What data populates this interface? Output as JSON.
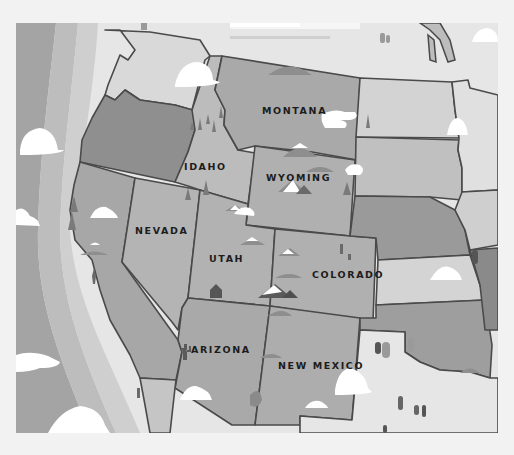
{
  "map": {
    "title": "Western United States illustrated map",
    "style": "grayscale illustration",
    "colors": {
      "background": "#f2f2f2",
      "ocean_outer": "#a4a4a4",
      "ocean_mid": "#bdbdbd",
      "ocean_inner": "#cfcfcf",
      "coast_foam": "#e4e4e4",
      "border": "#4a4a4a",
      "label": "#1c1c1c",
      "cloud": "#ffffff"
    },
    "states": [
      {
        "name": "Washington",
        "label": "",
        "fill": "#d9d9d9"
      },
      {
        "name": "Oregon",
        "label": "",
        "fill": "#8f8f8f"
      },
      {
        "name": "California",
        "label": "",
        "fill": "#a7a7a7"
      },
      {
        "name": "Idaho",
        "label": "IDAHO",
        "fill": "#bcbcbc"
      },
      {
        "name": "Nevada",
        "label": "NEVADA",
        "fill": "#b4b4b4"
      },
      {
        "name": "Montana",
        "label": "MONTANA",
        "fill": "#a9a9a9"
      },
      {
        "name": "Wyoming",
        "label": "WYOMING",
        "fill": "#b0b0b0"
      },
      {
        "name": "Utah",
        "label": "UTAH",
        "fill": "#b2b2b2"
      },
      {
        "name": "Colorado",
        "label": "COLORADO",
        "fill": "#b0b0b0"
      },
      {
        "name": "Arizona",
        "label": "ARIZONA",
        "fill": "#a9a9a9"
      },
      {
        "name": "New Mexico",
        "label": "NEW MEXICO",
        "fill": "#adadad"
      },
      {
        "name": "North Dakota",
        "label": "",
        "fill": "#d3d3d3"
      },
      {
        "name": "South Dakota",
        "label": "",
        "fill": "#c0c0c0"
      },
      {
        "name": "Nebraska",
        "label": "",
        "fill": "#9a9a9a"
      },
      {
        "name": "Kansas",
        "label": "",
        "fill": "#d4d4d4"
      },
      {
        "name": "Oklahoma",
        "label": "",
        "fill": "#9e9e9e"
      },
      {
        "name": "Texas",
        "label": "",
        "fill": "#e6e6e6"
      },
      {
        "name": "Minnesota",
        "label": "",
        "fill": "#e0e0e0"
      },
      {
        "name": "Iowa",
        "label": "",
        "fill": "#cfcfcf"
      },
      {
        "name": "Missouri",
        "label": "",
        "fill": "#8a8a8a"
      },
      {
        "name": "Canada",
        "label": "",
        "fill": "#e6e6e6"
      },
      {
        "name": "Mexico",
        "label": "",
        "fill": "#e6e6e6"
      }
    ],
    "labels": {
      "montana": "MONTANA",
      "idaho": "IDAHO",
      "wyoming": "WYOMING",
      "nevada": "NEVADA",
      "utah": "UTAH",
      "colorado": "COLORADO",
      "arizona": "ARIZONA",
      "new_mexico": "NEW MEXICO"
    }
  }
}
